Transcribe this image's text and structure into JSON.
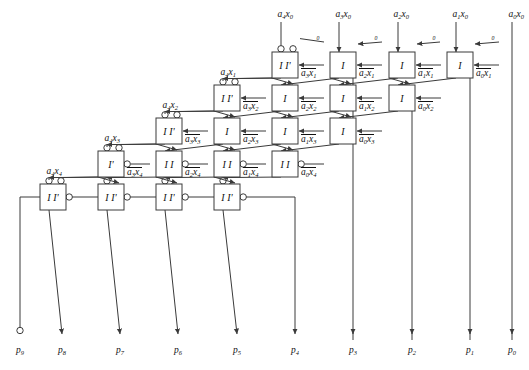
{
  "figure": {
    "type": "logic-array-diagram",
    "width": 529,
    "height": 370,
    "line_color": "#3a3a3a",
    "text_color": "#111111",
    "background": "#ffffff"
  },
  "grid": {
    "rows": 6,
    "columns": 4,
    "cell_w": 26,
    "cell_h": 26,
    "col_step": 58.5,
    "row_step": 33,
    "note": "each successive row is shifted left by one column step; bottom row is the final carry-propagate row"
  },
  "cells": [
    {
      "id": "r0c0",
      "row": 0,
      "col": 0,
      "x": 272,
      "y": 52,
      "label": "I I'",
      "top_bubble": true,
      "diag_bubble": true,
      "out_bubble": false,
      "side_in": "a3x1",
      "side_in_bar": true
    },
    {
      "id": "r0c1",
      "row": 0,
      "col": 1,
      "x": 330,
      "y": 52,
      "label": "I",
      "top_bubble": false,
      "diag_bubble": false,
      "out_bubble": false,
      "side_in": "a2x1",
      "side_in_bar": true
    },
    {
      "id": "r0c2",
      "row": 0,
      "col": 2,
      "x": 389,
      "y": 52,
      "label": "I",
      "top_bubble": false,
      "diag_bubble": false,
      "out_bubble": false,
      "side_in": "a1x1",
      "side_in_bar": true
    },
    {
      "id": "r0c3",
      "row": 0,
      "col": 3,
      "x": 447,
      "y": 52,
      "label": "I",
      "top_bubble": false,
      "diag_bubble": false,
      "out_bubble": false,
      "side_in": "a0x1",
      "side_in_bar": true
    },
    {
      "id": "r1c0",
      "row": 1,
      "col": 0,
      "x": 214,
      "y": 85,
      "label": "I I'",
      "top_bubble": true,
      "diag_bubble": true,
      "out_bubble": false,
      "side_in": "a3x2",
      "side_in_bar": true
    },
    {
      "id": "r1c1",
      "row": 1,
      "col": 1,
      "x": 272,
      "y": 85,
      "label": "I",
      "top_bubble": false,
      "diag_bubble": false,
      "out_bubble": false,
      "side_in": "a2x2",
      "side_in_bar": true
    },
    {
      "id": "r1c2",
      "row": 1,
      "col": 2,
      "x": 330,
      "y": 85,
      "label": "I",
      "top_bubble": false,
      "diag_bubble": false,
      "out_bubble": false,
      "side_in": "a1x2",
      "side_in_bar": true
    },
    {
      "id": "r1c3",
      "row": 1,
      "col": 3,
      "x": 389,
      "y": 85,
      "label": "I",
      "top_bubble": false,
      "diag_bubble": false,
      "out_bubble": false,
      "side_in": "a0x2",
      "side_in_bar": true
    },
    {
      "id": "r2c0",
      "row": 2,
      "col": 0,
      "x": 156,
      "y": 118,
      "label": "I I'",
      "top_bubble": true,
      "diag_bubble": true,
      "out_bubble": false,
      "side_in": "a3x3",
      "side_in_bar": true
    },
    {
      "id": "r2c1",
      "row": 2,
      "col": 1,
      "x": 214,
      "y": 118,
      "label": "I",
      "top_bubble": false,
      "diag_bubble": false,
      "out_bubble": false,
      "side_in": "a2x3",
      "side_in_bar": true
    },
    {
      "id": "r2c2",
      "row": 2,
      "col": 2,
      "x": 272,
      "y": 118,
      "label": "I",
      "top_bubble": false,
      "diag_bubble": false,
      "out_bubble": false,
      "side_in": "a1x3",
      "side_in_bar": true
    },
    {
      "id": "r2c3",
      "row": 2,
      "col": 3,
      "x": 330,
      "y": 118,
      "label": "I",
      "top_bubble": false,
      "diag_bubble": false,
      "out_bubble": false,
      "side_in": "a0x3",
      "side_in_bar": true
    },
    {
      "id": "r3c0",
      "row": 3,
      "col": 0,
      "x": 98,
      "y": 151,
      "label": "I'",
      "top_bubble": true,
      "diag_bubble": true,
      "out_bubble": true,
      "side_in": "a3x4",
      "side_in_bar": true
    },
    {
      "id": "r3c1",
      "row": 3,
      "col": 1,
      "x": 156,
      "y": 151,
      "label": "I I",
      "top_bubble": false,
      "diag_bubble": false,
      "out_bubble": true,
      "side_in": "a2x4",
      "side_in_bar": true
    },
    {
      "id": "r3c2",
      "row": 3,
      "col": 2,
      "x": 214,
      "y": 151,
      "label": "I I",
      "top_bubble": false,
      "diag_bubble": false,
      "out_bubble": true,
      "side_in": "a1x4",
      "side_in_bar": true
    },
    {
      "id": "r3c3",
      "row": 3,
      "col": 3,
      "x": 272,
      "y": 151,
      "label": "I I",
      "top_bubble": false,
      "diag_bubble": false,
      "out_bubble": true,
      "side_in": "a0x4",
      "side_in_bar": true
    },
    {
      "id": "r4c0",
      "row": 4,
      "col": 0,
      "x": 40,
      "y": 184,
      "label": "I I'",
      "top_bubble": true,
      "diag_bubble": true,
      "out_bubble": true,
      "side_in": null,
      "side_in_bar": false
    },
    {
      "id": "r4c1",
      "row": 4,
      "col": 1,
      "x": 98,
      "y": 184,
      "label": "I I'",
      "top_bubble": true,
      "diag_bubble": false,
      "out_bubble": true,
      "side_in": null,
      "side_in_bar": false
    },
    {
      "id": "r4c2",
      "row": 4,
      "col": 2,
      "x": 156,
      "y": 184,
      "label": "I I'",
      "top_bubble": true,
      "diag_bubble": false,
      "out_bubble": true,
      "side_in": null,
      "side_in_bar": false
    },
    {
      "id": "r4c3",
      "row": 4,
      "col": 3,
      "x": 214,
      "y": 184,
      "label": "I I'",
      "top_bubble": true,
      "diag_bubble": false,
      "out_bubble": true,
      "side_in": null,
      "side_in_bar": false
    }
  ],
  "top_inputs": [
    {
      "label": "a4x0",
      "x": 285,
      "y": 14
    },
    {
      "label": "a3x0",
      "x": 343,
      "y": 14
    },
    {
      "label": "a2x0",
      "x": 401,
      "y": 14
    },
    {
      "label": "a1x0",
      "x": 460,
      "y": 14
    },
    {
      "label": "a0x0",
      "x": 516,
      "y": 14
    }
  ],
  "zero_inputs": [
    {
      "label": "0",
      "x": 318,
      "y": 36
    },
    {
      "label": "0",
      "x": 376,
      "y": 36
    },
    {
      "label": "0",
      "x": 434,
      "y": 36
    },
    {
      "label": "0",
      "x": 493,
      "y": 36
    }
  ],
  "left_inputs": [
    {
      "label": "a4x1",
      "x": 228,
      "y": 72
    },
    {
      "label": "a4x2",
      "x": 170,
      "y": 105
    },
    {
      "label": "a4x3",
      "x": 112,
      "y": 138
    },
    {
      "label": "a4x4",
      "x": 54,
      "y": 171
    }
  ],
  "outputs": [
    {
      "label": "p9",
      "x": 20,
      "terminal": "circle"
    },
    {
      "label": "p8",
      "x": 62,
      "terminal": "arrow"
    },
    {
      "label": "p7",
      "x": 120,
      "terminal": "arrow"
    },
    {
      "label": "p6",
      "x": 178,
      "terminal": "arrow"
    },
    {
      "label": "p5",
      "x": 237,
      "terminal": "arrow"
    },
    {
      "label": "p4",
      "x": 295,
      "terminal": "arrow"
    },
    {
      "label": "p3",
      "x": 353,
      "terminal": "arrow"
    },
    {
      "label": "p2",
      "x": 412,
      "terminal": "arrow"
    },
    {
      "label": "p1",
      "x": 470,
      "terminal": "arrow"
    },
    {
      "label": "p0",
      "x": 512,
      "terminal": "arrow"
    }
  ],
  "pass_through_lines": [
    {
      "name": "p3-line",
      "x": 353,
      "from_y": 78,
      "to_y": 340
    },
    {
      "name": "p2-line",
      "x": 412,
      "from_y": 111,
      "to_y": 340
    },
    {
      "name": "p1-line",
      "x": 470,
      "from_y": 78,
      "to_y": 340
    },
    {
      "name": "p0-line",
      "x": 512,
      "from_y": 26,
      "to_y": 340
    }
  ]
}
